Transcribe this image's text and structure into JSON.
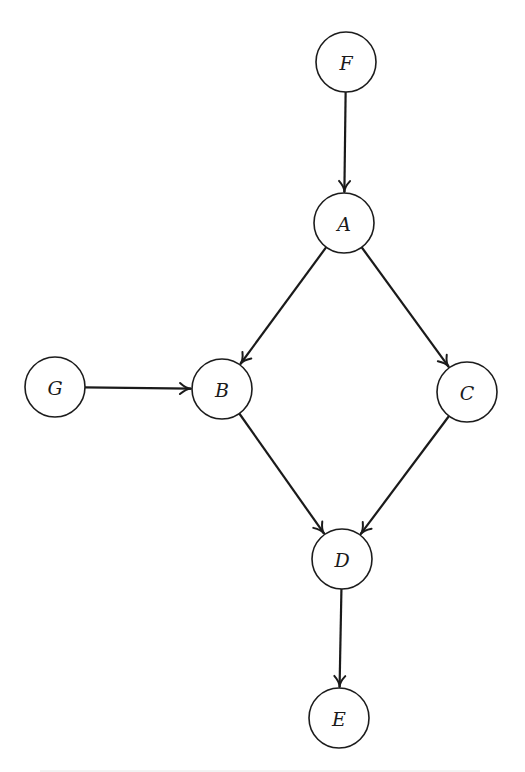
{
  "diagram": {
    "type": "directed-graph",
    "node_radius": 30,
    "colors": {
      "stroke": "#1c1c1c",
      "background": "#ffffff"
    },
    "nodes": [
      {
        "id": "F",
        "label": "F",
        "x": 346,
        "y": 62
      },
      {
        "id": "A",
        "label": "A",
        "x": 344,
        "y": 223
      },
      {
        "id": "G",
        "label": "G",
        "x": 55,
        "y": 387
      },
      {
        "id": "B",
        "label": "B",
        "x": 222,
        "y": 389
      },
      {
        "id": "C",
        "label": "C",
        "x": 467,
        "y": 392
      },
      {
        "id": "D",
        "label": "D",
        "x": 342,
        "y": 559
      },
      {
        "id": "E",
        "label": "E",
        "x": 339,
        "y": 718
      }
    ],
    "edges": [
      {
        "from": "F",
        "to": "A"
      },
      {
        "from": "A",
        "to": "B"
      },
      {
        "from": "A",
        "to": "C"
      },
      {
        "from": "G",
        "to": "B"
      },
      {
        "from": "B",
        "to": "D"
      },
      {
        "from": "C",
        "to": "D"
      },
      {
        "from": "D",
        "to": "E"
      }
    ]
  }
}
